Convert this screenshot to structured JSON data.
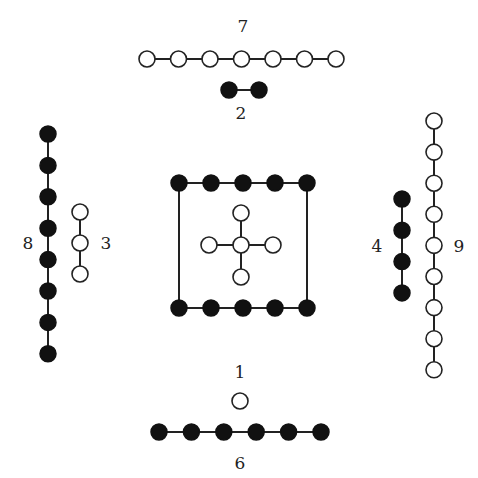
{
  "legend": {
    "open_circle": "yang (odd)",
    "filled_circle": "yin (even)"
  },
  "groups": [
    {
      "id": "g7",
      "label": "7",
      "count": 7,
      "kind": "yang",
      "position": "top-outer"
    },
    {
      "id": "g2",
      "label": "2",
      "count": 2,
      "kind": "yin",
      "position": "top-inner"
    },
    {
      "id": "g8",
      "label": "8",
      "count": 8,
      "kind": "yin",
      "position": "left-outer"
    },
    {
      "id": "g3",
      "label": "3",
      "count": 3,
      "kind": "yang",
      "position": "left-inner"
    },
    {
      "id": "g4",
      "label": "4",
      "count": 4,
      "kind": "yin",
      "position": "right-inner"
    },
    {
      "id": "g9",
      "label": "9",
      "count": 9,
      "kind": "yang",
      "position": "right-outer"
    },
    {
      "id": "g1",
      "label": "1",
      "count": 1,
      "kind": "yang",
      "position": "bottom-inner"
    },
    {
      "id": "g6",
      "label": "6",
      "count": 6,
      "kind": "yin",
      "position": "bottom-outer"
    },
    {
      "id": "g10",
      "label": "",
      "count": 10,
      "kind": "yin",
      "position": "center-square"
    },
    {
      "id": "g5",
      "label": "",
      "count": 5,
      "kind": "yang",
      "position": "center-cross"
    }
  ]
}
